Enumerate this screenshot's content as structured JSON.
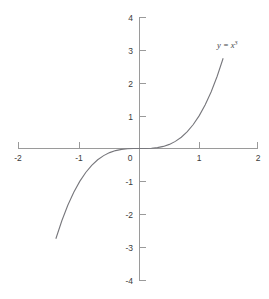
{
  "chart_data": {
    "type": "line",
    "title": "",
    "subtitle": "",
    "xlabel": "",
    "ylabel": "",
    "xlim": [
      -2,
      2
    ],
    "ylim": [
      -4,
      4
    ],
    "grid": false,
    "legend": "none",
    "annotations": [
      {
        "name": "curve-equation-label",
        "text": "y = x",
        "exponent": "3",
        "full_text": "y = x³",
        "x": 1.42,
        "y": 3.05
      }
    ],
    "x_ticks": [
      {
        "value": -2,
        "label": "-2"
      },
      {
        "value": -1,
        "label": "-1"
      },
      {
        "value": 0,
        "label": "0"
      },
      {
        "value": 1,
        "label": "1"
      },
      {
        "value": 2,
        "label": "2"
      }
    ],
    "y_ticks": [
      {
        "value": 4,
        "label": "4"
      },
      {
        "value": 3,
        "label": "3"
      },
      {
        "value": 2,
        "label": "2"
      },
      {
        "value": 1,
        "label": "1"
      },
      {
        "value": -1,
        "label": "-1"
      },
      {
        "value": -2,
        "label": "-2"
      },
      {
        "value": -3,
        "label": "-3"
      },
      {
        "value": -4,
        "label": "-4"
      }
    ],
    "origin_label": "0",
    "series": [
      {
        "name": "y = x³",
        "equation": "y = x^3",
        "color": "#77777c",
        "x_start": -1.4,
        "x_end": 1.4,
        "x": [
          -1.4,
          -1.3,
          -1.2,
          -1.1,
          -1.0,
          -0.9,
          -0.8,
          -0.7,
          -0.6,
          -0.5,
          -0.4,
          -0.3,
          -0.2,
          -0.1,
          0.0,
          0.1,
          0.2,
          0.3,
          0.4,
          0.5,
          0.6,
          0.7,
          0.8,
          0.9,
          1.0,
          1.1,
          1.2,
          1.3,
          1.4
        ],
        "values": [
          -2.744,
          -2.197,
          -1.728,
          -1.331,
          -1.0,
          -0.729,
          -0.512,
          -0.343,
          -0.216,
          -0.125,
          -0.064,
          -0.027,
          -0.008,
          -0.001,
          0.0,
          0.001,
          0.008,
          0.027,
          0.064,
          0.125,
          0.216,
          0.343,
          0.512,
          0.729,
          1.0,
          1.331,
          1.728,
          2.197,
          2.744
        ]
      }
    ],
    "colors": {
      "background": "#ffffff",
      "axis": "#9a9a9a",
      "curve": "#77777c",
      "tick_text": "#3a3a3a",
      "label_text": "#44444a"
    }
  }
}
